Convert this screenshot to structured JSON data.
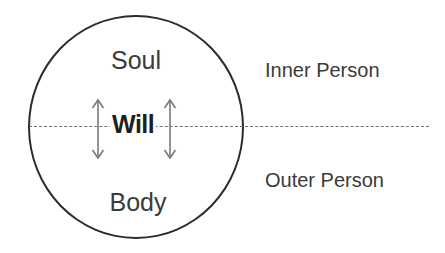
{
  "diagram": {
    "shape": "circle",
    "stroke_color": "#2b2b2b",
    "divider_color": "#6f6f6f",
    "text_color": "#3a3a3a",
    "background": "#ffffff"
  },
  "circle_labels": {
    "top": "Soul",
    "middle": "Will",
    "bottom": "Body"
  },
  "side_labels": {
    "upper": "Inner Person",
    "lower": "Outer Person"
  },
  "arrows": {
    "left": {
      "name": "double-headed-vertical-arrow",
      "direction": "both",
      "color": "#7a7a7a"
    },
    "right": {
      "name": "double-headed-vertical-arrow",
      "direction": "both",
      "color": "#7a7a7a"
    }
  }
}
